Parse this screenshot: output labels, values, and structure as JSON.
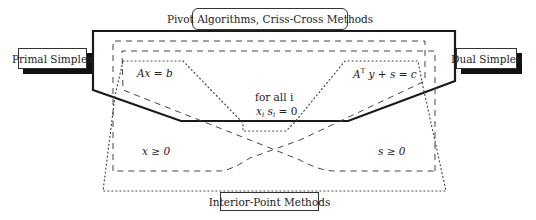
{
  "diagram": {
    "labels": {
      "pivot": "Pivot Algorithms, Criss-Cross Methods",
      "primal": "Primal Simplex",
      "dual": "Dual Simplex",
      "interior": "Interior-Point Methods"
    },
    "regions": {
      "primal_feasibility": "Ax = b",
      "dual_feasibility_lhs": "A",
      "dual_feasibility_sup": "T",
      "dual_feasibility_rhs": " y + s = c",
      "complementarity_line1": "for all i",
      "complementarity_var_x": "x",
      "complementarity_sub1": "i",
      "complementarity_var_s": " s",
      "complementarity_sub2": "i",
      "complementarity_rhs": " = 0",
      "x_nonneg": "x ≥ 0",
      "s_nonneg": "s ≥ 0"
    },
    "line_styles": {
      "solid": "Pivot Algorithms, Criss-Cross Methods",
      "dashed": "Primal / Dual Simplex",
      "dotted": "Interior-Point Methods"
    },
    "colors": {
      "line": "#1a1a1a",
      "shadow": "#111111",
      "background": "#ffffff"
    }
  }
}
